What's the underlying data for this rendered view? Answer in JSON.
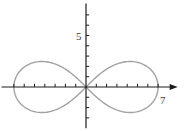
{
  "figure": {
    "background_color": "#ffffff",
    "axis_color": "#1c1c1c",
    "curve_color": "#a2a2a2",
    "label_color": "#3d3d3d"
  },
  "chart_data": {
    "type": "line",
    "curve_name": "lemniscate-of-bernoulli-figure-eight",
    "equation": "r^2 = a^2 * cos(2*theta)",
    "a": 7,
    "title": "",
    "xlabel": "",
    "ylabel": "",
    "grid": false,
    "legend": false,
    "x_axis": {
      "label": "7",
      "label_value": 7,
      "tick_step": 1,
      "min": -8.2,
      "max": 8.9,
      "ticks": [
        -7,
        -6,
        -5,
        -4,
        -3,
        -2,
        -1,
        1,
        2,
        3,
        4,
        5,
        6,
        7
      ],
      "arrow": "right"
    },
    "y_axis": {
      "label": "5",
      "label_value": 5,
      "tick_step": 1,
      "min": -4,
      "max": 8.1,
      "ticks": [
        -3,
        -2,
        -1,
        1,
        2,
        3,
        4,
        5,
        6,
        7
      ],
      "arrow": "none"
    },
    "key_points": [
      [
        -7,
        0
      ],
      [
        0,
        0
      ],
      [
        7,
        0
      ],
      [
        4.29,
        2.47
      ],
      [
        -4.29,
        2.47
      ],
      [
        4.29,
        -2.47
      ],
      [
        -4.29,
        -2.47
      ]
    ]
  }
}
